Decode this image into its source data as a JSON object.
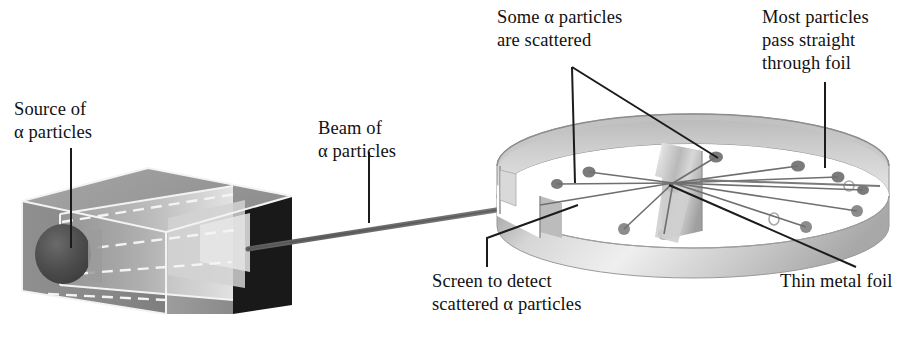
{
  "diagram": {
    "background_color": "#ffffff",
    "width": 917,
    "height": 350
  },
  "labels": {
    "source": {
      "line1": "Source of",
      "line2": "α particles"
    },
    "beam": {
      "line1": "Beam of",
      "line2": "α particles"
    },
    "scattered": {
      "line1": "Some α particles",
      "line2": "are scattered"
    },
    "most": {
      "line1": "Most particles",
      "line2": "pass straight",
      "line3": "through foil"
    },
    "screen": {
      "line1": "Screen to detect",
      "line2": "scattered α particles"
    },
    "foil": {
      "line1": "Thin metal foil"
    }
  },
  "colors": {
    "ink": "#111111",
    "leader_line": "#1b1b1b",
    "box_top": "#9c9c9c",
    "box_front": "#8b8b8b",
    "box_side_dark": "#1a1a1a",
    "box_edge_light": "#f2f2f2",
    "source_sphere": "#4a4a4a",
    "beam": "#6f6f6f",
    "ring_band": "#c9c9c9",
    "ring_band_light": "#e8e8e8",
    "ring_band_dark": "#a5a5a5",
    "ring_inner_floor": "#ffffff",
    "detector_dot": "#7d7d7d",
    "foil_plate": "#bdbdbd",
    "scatter_ray": "#6b6b6b"
  },
  "apparatus": {
    "source_box": {
      "name": "lead block enclosing radioactive source",
      "aperture_note": "dashed channel guiding beam toward exit face"
    },
    "beam": {
      "name": "collimated alpha particle beam"
    },
    "detector_ring": {
      "name": "circular zinc sulfide scintillation screen",
      "detector_dot_count": 12,
      "entry_gap": true
    },
    "foil": {
      "name": "thin metal (gold) foil target at ring center"
    },
    "scatter_rays": {
      "count": 9,
      "origin": "foil center"
    }
  }
}
